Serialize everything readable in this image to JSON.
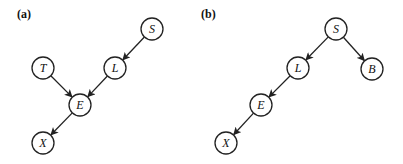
{
  "panels": [
    {
      "label": "(a)",
      "label_pos": [
        17,
        7
      ],
      "nodes": [
        {
          "id": "S",
          "label": "S",
          "x": 152,
          "y": 29
        },
        {
          "id": "L",
          "label": "L",
          "x": 115,
          "y": 68
        },
        {
          "id": "T",
          "label": "T",
          "x": 43,
          "y": 68
        },
        {
          "id": "E",
          "label": "E",
          "x": 80,
          "y": 105
        },
        {
          "id": "X",
          "label": "X",
          "x": 43,
          "y": 143
        }
      ],
      "edges": [
        {
          "from": "S",
          "to": "L"
        },
        {
          "from": "T",
          "to": "E"
        },
        {
          "from": "L",
          "to": "E"
        },
        {
          "from": "E",
          "to": "X"
        }
      ]
    },
    {
      "label": "(b)",
      "label_pos": [
        201,
        7
      ],
      "nodes": [
        {
          "id": "S",
          "label": "S",
          "x": 336,
          "y": 29
        },
        {
          "id": "L",
          "label": "L",
          "x": 298,
          "y": 68
        },
        {
          "id": "B",
          "label": "B",
          "x": 372,
          "y": 69
        },
        {
          "id": "E",
          "label": "E",
          "x": 261,
          "y": 105
        },
        {
          "id": "X",
          "label": "X",
          "x": 226,
          "y": 143
        }
      ],
      "edges": [
        {
          "from": "S",
          "to": "L"
        },
        {
          "from": "S",
          "to": "B"
        },
        {
          "from": "L",
          "to": "E"
        },
        {
          "from": "E",
          "to": "X"
        }
      ]
    }
  ],
  "style": {
    "node_radius": 11,
    "stroke_color": "#222222",
    "fill_color": "#ffffff"
  }
}
